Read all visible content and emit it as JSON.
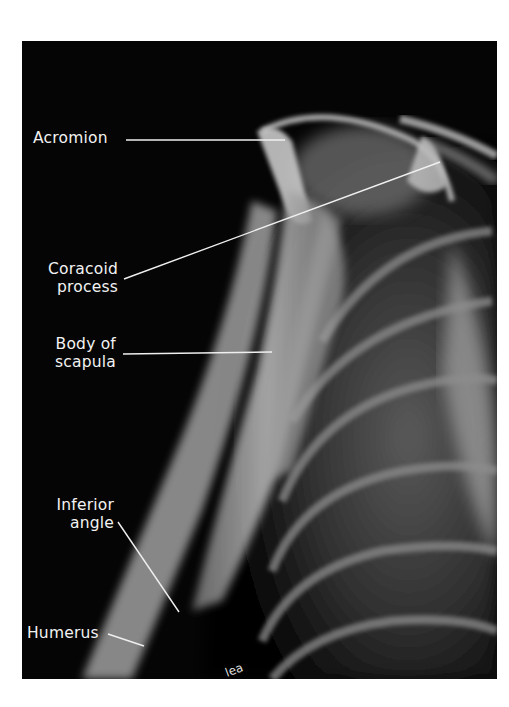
{
  "figure": {
    "image_description": "Lateral (Y-view) radiograph of the shoulder showing scapula and humerus",
    "background_color": "#050505",
    "label_color": "#f2f2f2",
    "labels": [
      {
        "id": "acromion",
        "lines": [
          "Acromion"
        ]
      },
      {
        "id": "coracoid",
        "lines": [
          "Coracoid",
          "process"
        ]
      },
      {
        "id": "body",
        "lines": [
          "Body of",
          "scapula"
        ]
      },
      {
        "id": "inferior",
        "lines": [
          "Inferior",
          "angle"
        ]
      },
      {
        "id": "humerus",
        "lines": [
          "Humerus"
        ]
      }
    ]
  }
}
